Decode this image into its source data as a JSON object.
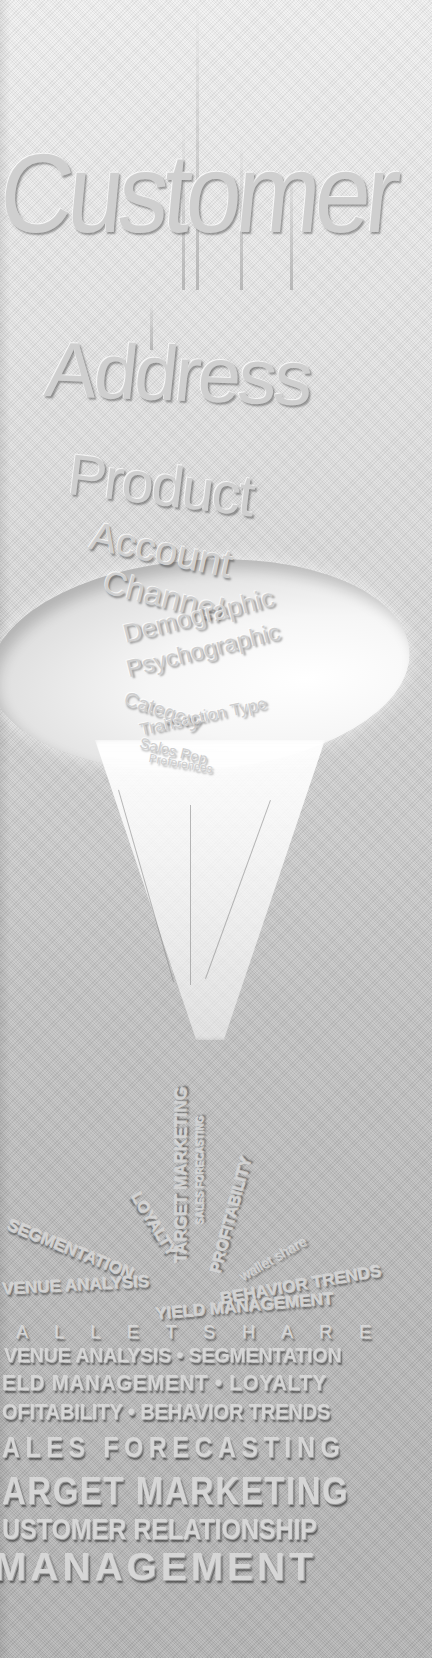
{
  "funnel_words": {
    "customer": "Customer",
    "address": "Address",
    "product": "Product",
    "account": "Account",
    "channel": "Channel",
    "demographic": "Demographic",
    "psychographic": "Psychographic",
    "category": "Category",
    "transaction_type": "Transaction Type",
    "sales_rep": "Sales Rep",
    "preferences": "Preferences"
  },
  "output_words": {
    "target_marketing": "TARGET MARKETING",
    "sales_forecasting": "SALES FORECASTING",
    "profitability": "PROFITABILITY",
    "loyalty": "LOYALTY",
    "segmentation": "SEGMENTATION",
    "wallet_share": "wallet share",
    "revenue_analysis": "VENUE ANALYSIS",
    "behavior_trends": "BEHAVIOR TRENDS",
    "yield_management": "YIELD MANAGEMENT"
  },
  "bottom_lines": [
    "A L L E T   S H A R E",
    "VENUE ANALYSIS • SEGMENTATION",
    "ELD MANAGEMENT • LOYALTY",
    "OFITABILITY • BEHAVIOR TRENDS",
    "ALES  FORECASTING",
    "ARGET MARKETING",
    "USTOMER RELATIONSHIP",
    "MANAGEMENT"
  ]
}
